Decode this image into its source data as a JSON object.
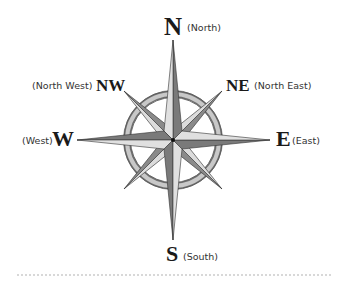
{
  "diagram": {
    "type": "compass-rose",
    "directions": {
      "n": {
        "abbr": "N",
        "name": "(North)"
      },
      "ne": {
        "abbr": "NE",
        "name": "(North East)"
      },
      "e": {
        "abbr": "E",
        "name": "(East)"
      },
      "s": {
        "abbr": "S",
        "name": "(South)"
      },
      "w": {
        "abbr": "W",
        "name": "(West)"
      },
      "nw": {
        "abbr": "NW",
        "name": "(North West)"
      }
    },
    "colors": {
      "light": "#d9d9d9",
      "dark": "#7a7a7a",
      "outline": "#333333",
      "ring": "#9a9a9a"
    }
  }
}
